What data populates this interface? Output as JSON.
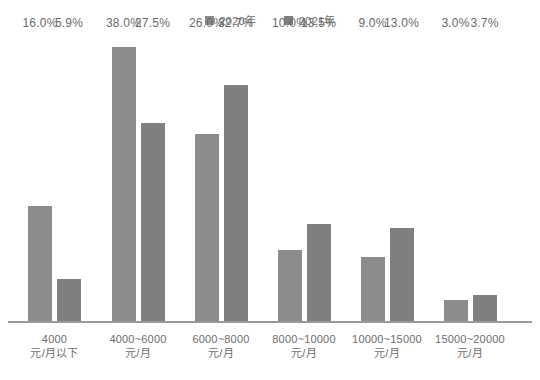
{
  "legend": {
    "position": "top-center",
    "entries": [
      {
        "label": "2020年",
        "color": "#8c8c8c",
        "icon": "square-swatch-icon"
      },
      {
        "label": "2021年",
        "color": "#7f7f7f",
        "icon": "square-swatch-icon"
      }
    ]
  },
  "axis": {
    "baseline_color": "#9a9a9a",
    "grid": false,
    "ylabel": "",
    "xlabel": ""
  },
  "chart_data": {
    "type": "bar",
    "title": "",
    "subtitle": "",
    "xlabel": "",
    "ylabel": "",
    "ylim": [
      0,
      40
    ],
    "grid": false,
    "legend_position": "top-center",
    "categories": [
      "4000\n元/月以下",
      "4000~6000\n元/月",
      "6000~8000\n元/月",
      "8000~10000\n元/月",
      "10000~15000\n元/月",
      "15000~20000\n元/月"
    ],
    "category_lines": [
      [
        "4000",
        "元/月以下"
      ],
      [
        "4000~6000",
        "元/月"
      ],
      [
        "6000~8000",
        "元/月"
      ],
      [
        "8000~10000",
        "元/月"
      ],
      [
        "10000~15000",
        "元/月"
      ],
      [
        "15000~20000",
        "元/月"
      ]
    ],
    "series": [
      {
        "name": "2020年",
        "color": "#8c8c8c",
        "values": [
          16.0,
          38.0,
          26.0,
          10.0,
          9.0,
          3.0
        ],
        "labels": [
          "16.0%",
          "38.0%",
          "26.0%",
          "10.0%",
          "9.0%",
          "3.0%"
        ]
      },
      {
        "name": "2021年",
        "color": "#7f7f7f",
        "values": [
          5.9,
          27.5,
          32.7,
          13.5,
          13.0,
          3.7
        ],
        "labels": [
          "5.9%",
          "27.5%",
          "32.7%",
          "13.5%",
          "13.0%",
          "3.7%"
        ]
      }
    ]
  }
}
